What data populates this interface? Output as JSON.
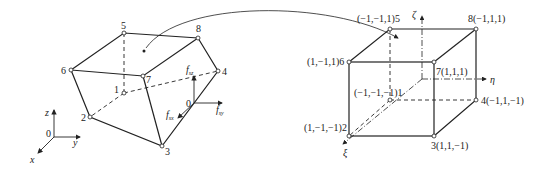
{
  "physical_element": {
    "nodes": [
      {
        "id": "1",
        "label": "1",
        "x": 124,
        "y": 93
      },
      {
        "id": "2",
        "label": "2",
        "x": 90,
        "y": 117
      },
      {
        "id": "3",
        "label": "3",
        "x": 162,
        "y": 146
      },
      {
        "id": "4",
        "label": "4",
        "x": 218,
        "y": 71
      },
      {
        "id": "5",
        "label": "5",
        "x": 124,
        "y": 33
      },
      {
        "id": "6",
        "label": "6",
        "x": 71,
        "y": 70
      },
      {
        "id": "7",
        "label": "7",
        "x": 143,
        "y": 76
      },
      {
        "id": "8",
        "label": "8",
        "x": 198,
        "y": 38
      }
    ],
    "force_labels": {
      "fsz": "f",
      "fsz_sub": "sz",
      "fsy": "f",
      "fsy_sub": "sy",
      "fsx": "f",
      "fsx_sub": "sx",
      "origin": "0"
    },
    "axes": {
      "x": "x",
      "y": "y",
      "z": "z",
      "origin": "0"
    }
  },
  "reference_element": {
    "nodes": [
      {
        "id": "1",
        "label": "(−1,−1,−1)1"
      },
      {
        "id": "2",
        "label": "(1,−1,−1)2"
      },
      {
        "id": "3",
        "label": "3(1,1,−1)"
      },
      {
        "id": "4",
        "label": "4(−1,1,−1)"
      },
      {
        "id": "5",
        "label": "(−1,−1,1)5"
      },
      {
        "id": "6",
        "label": "(1,−1,1)6"
      },
      {
        "id": "7",
        "label": "7(1,1,1)"
      },
      {
        "id": "8",
        "label": "8(−1,1,1)"
      }
    ],
    "axes": {
      "xi": "ξ",
      "eta": "η",
      "zeta": "ζ"
    }
  }
}
